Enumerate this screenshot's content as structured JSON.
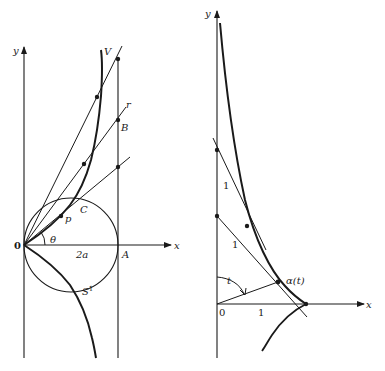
{
  "figures": {
    "left": {
      "axis_labels": {
        "x": "x",
        "y": "y"
      },
      "origin": "0",
      "points": {
        "A": "A",
        "B": "B",
        "C": "C",
        "p": "p",
        "V": "V",
        "r": "r"
      },
      "angle": "θ",
      "diameter": "2a",
      "circle": "S",
      "circle_sup": "1"
    },
    "right": {
      "axis_labels": {
        "x": "x",
        "y": "y"
      },
      "origin": "0",
      "tick_x": "1",
      "segment_labels": [
        "1",
        "1"
      ],
      "angle": "t",
      "curve_point": "α(t)"
    }
  }
}
